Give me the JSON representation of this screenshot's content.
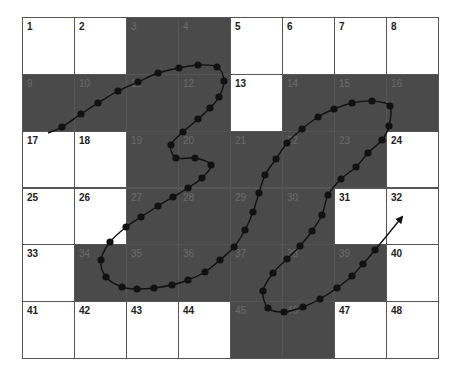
{
  "grid": {
    "columns": 8,
    "rows": 6,
    "colors": {
      "white": "#ffffff",
      "shaded": "#4a4a4a",
      "line": "#111111",
      "dot": "#111111"
    },
    "cells": [
      {
        "n": "1",
        "r": 0,
        "c": 0,
        "shade": false
      },
      {
        "n": "2",
        "r": 0,
        "c": 1,
        "shade": false
      },
      {
        "n": "3",
        "r": 0,
        "c": 2,
        "shade": true
      },
      {
        "n": "4",
        "r": 0,
        "c": 3,
        "shade": true
      },
      {
        "n": "5",
        "r": 0,
        "c": 4,
        "shade": false
      },
      {
        "n": "6",
        "r": 0,
        "c": 5,
        "shade": false
      },
      {
        "n": "7",
        "r": 0,
        "c": 6,
        "shade": false
      },
      {
        "n": "8",
        "r": 0,
        "c": 7,
        "shade": false
      },
      {
        "n": "9",
        "r": 1,
        "c": 0,
        "shade": true
      },
      {
        "n": "10",
        "r": 1,
        "c": 1,
        "shade": true
      },
      {
        "n": "11",
        "r": 1,
        "c": 2,
        "shade": true
      },
      {
        "n": "12",
        "r": 1,
        "c": 3,
        "shade": true
      },
      {
        "n": "13",
        "r": 1,
        "c": 4,
        "shade": false
      },
      {
        "n": "14",
        "r": 1,
        "c": 5,
        "shade": true
      },
      {
        "n": "15",
        "r": 1,
        "c": 6,
        "shade": true
      },
      {
        "n": "16",
        "r": 1,
        "c": 7,
        "shade": true
      },
      {
        "n": "17",
        "r": 2,
        "c": 0,
        "shade": false
      },
      {
        "n": "18",
        "r": 2,
        "c": 1,
        "shade": false
      },
      {
        "n": "19",
        "r": 2,
        "c": 2,
        "shade": true
      },
      {
        "n": "20",
        "r": 2,
        "c": 3,
        "shade": true
      },
      {
        "n": "21",
        "r": 2,
        "c": 4,
        "shade": true
      },
      {
        "n": "22",
        "r": 2,
        "c": 5,
        "shade": true
      },
      {
        "n": "23",
        "r": 2,
        "c": 6,
        "shade": true
      },
      {
        "n": "24",
        "r": 2,
        "c": 7,
        "shade": false
      },
      {
        "n": "25",
        "r": 3,
        "c": 0,
        "shade": false
      },
      {
        "n": "26",
        "r": 3,
        "c": 1,
        "shade": false
      },
      {
        "n": "27",
        "r": 3,
        "c": 2,
        "shade": true
      },
      {
        "n": "28",
        "r": 3,
        "c": 3,
        "shade": true
      },
      {
        "n": "29",
        "r": 3,
        "c": 4,
        "shade": true
      },
      {
        "n": "30",
        "r": 3,
        "c": 5,
        "shade": true
      },
      {
        "n": "31",
        "r": 3,
        "c": 6,
        "shade": false
      },
      {
        "n": "32",
        "r": 3,
        "c": 7,
        "shade": false
      },
      {
        "n": "33",
        "r": 4,
        "c": 0,
        "shade": false
      },
      {
        "n": "34",
        "r": 4,
        "c": 1,
        "shade": true
      },
      {
        "n": "35",
        "r": 4,
        "c": 2,
        "shade": true
      },
      {
        "n": "36",
        "r": 4,
        "c": 3,
        "shade": true
      },
      {
        "n": "37",
        "r": 4,
        "c": 4,
        "shade": true
      },
      {
        "n": "38",
        "r": 4,
        "c": 5,
        "shade": true
      },
      {
        "n": "39",
        "r": 4,
        "c": 6,
        "shade": true
      },
      {
        "n": "40",
        "r": 4,
        "c": 7,
        "shade": false
      },
      {
        "n": "41",
        "r": 5,
        "c": 0,
        "shade": false
      },
      {
        "n": "42",
        "r": 5,
        "c": 1,
        "shade": false
      },
      {
        "n": "43",
        "r": 5,
        "c": 2,
        "shade": false
      },
      {
        "n": "44",
        "r": 5,
        "c": 3,
        "shade": false
      },
      {
        "n": "45",
        "r": 5,
        "c": 4,
        "shade": true
      },
      {
        "n": "46",
        "r": 5,
        "c": 5,
        "shade": true
      },
      {
        "n": "47",
        "r": 5,
        "c": 6,
        "shade": false
      },
      {
        "n": "48",
        "r": 5,
        "c": 7,
        "shade": false
      }
    ]
  },
  "path": {
    "start": [
      48,
      133
    ],
    "points": [
      [
        62,
        127
      ],
      [
        81,
        114
      ],
      [
        98,
        103
      ],
      [
        118,
        91
      ],
      [
        138,
        82
      ],
      [
        158,
        73
      ],
      [
        179,
        68
      ],
      [
        198,
        65
      ],
      [
        217,
        67
      ],
      [
        224,
        81
      ],
      [
        219,
        97
      ],
      [
        210,
        108
      ],
      [
        198,
        119
      ],
      [
        183,
        132
      ],
      [
        171,
        145
      ],
      [
        176,
        158
      ],
      [
        195,
        158
      ],
      [
        211,
        165
      ],
      [
        202,
        178
      ],
      [
        188,
        188
      ],
      [
        173,
        197
      ],
      [
        158,
        206
      ],
      [
        141,
        217
      ],
      [
        126,
        227
      ],
      [
        110,
        242
      ],
      [
        101,
        260
      ],
      [
        106,
        277
      ],
      [
        122,
        287
      ],
      [
        137,
        289
      ],
      [
        154,
        288
      ],
      [
        172,
        285
      ],
      [
        188,
        280
      ],
      [
        205,
        272
      ],
      [
        220,
        260
      ],
      [
        234,
        247
      ],
      [
        245,
        230
      ],
      [
        253,
        212
      ],
      [
        259,
        193
      ],
      [
        265,
        175
      ],
      [
        276,
        159
      ],
      [
        287,
        143
      ],
      [
        302,
        129
      ],
      [
        318,
        117
      ],
      [
        334,
        109
      ],
      [
        352,
        103
      ],
      [
        372,
        101
      ],
      [
        390,
        106
      ],
      [
        389,
        126
      ],
      [
        382,
        140
      ],
      [
        368,
        153
      ],
      [
        356,
        167
      ],
      [
        341,
        179
      ],
      [
        328,
        195
      ],
      [
        322,
        215
      ],
      [
        312,
        231
      ],
      [
        300,
        246
      ],
      [
        287,
        259
      ],
      [
        273,
        273
      ],
      [
        263,
        291
      ],
      [
        268,
        308
      ],
      [
        284,
        312
      ],
      [
        303,
        307
      ],
      [
        320,
        299
      ],
      [
        337,
        288
      ],
      [
        352,
        276
      ],
      [
        363,
        264
      ],
      [
        375,
        250
      ]
    ],
    "end_arrow": [
      402,
      217
    ]
  }
}
